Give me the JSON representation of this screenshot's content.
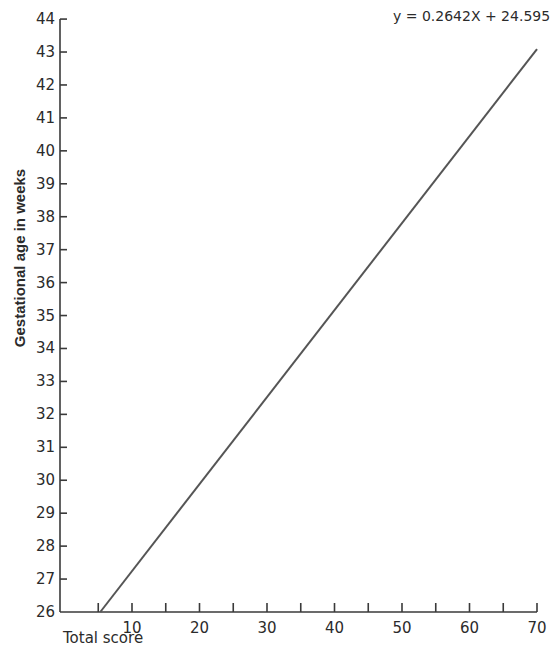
{
  "chart_data": {
    "type": "line",
    "title": "",
    "xlabel": "Total score",
    "ylabel": "Gestational age in weeks",
    "equation": "y = 0.2642X + 24.595",
    "slope": 0.2642,
    "intercept": 24.595,
    "xlim": [
      0,
      70
    ],
    "ylim": [
      26,
      44
    ],
    "x_ticks": [
      5,
      10,
      15,
      20,
      25,
      30,
      35,
      40,
      45,
      50,
      55,
      60,
      65,
      70
    ],
    "x_tick_labels": [
      "10",
      "20",
      "30",
      "40",
      "50",
      "60",
      "70"
    ],
    "y_ticks": [
      26,
      27,
      28,
      29,
      30,
      31,
      32,
      33,
      34,
      35,
      36,
      37,
      38,
      39,
      40,
      41,
      42,
      43,
      44
    ],
    "series": [
      {
        "name": "y = 0.2642X + 24.595",
        "x": [
          5.3,
          70
        ],
        "y": [
          26.0,
          43.09
        ]
      }
    ],
    "grid": false,
    "legend": "none",
    "color": "#555555"
  }
}
